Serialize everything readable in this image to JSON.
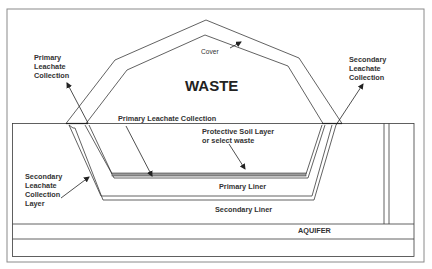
{
  "diagram": {
    "labels": {
      "waste": "WASTE",
      "cover": "Cover",
      "primary_leachate_collection_top": [
        "Primary",
        "Leachate",
        "Collection"
      ],
      "secondary_leachate_collection_top": [
        "Secondary",
        "Leachate",
        "Collection"
      ],
      "primary_leachate_collection_mid": "Primary Leachate Collection",
      "protective_soil_layer": [
        "Protective Soil Layer",
        "or select waste"
      ],
      "secondary_leachate_collection_layer": [
        "Secondary",
        "Leachate",
        "Collection",
        "Layer"
      ],
      "primary_liner": "Primary Liner",
      "secondary_liner": "Secondary Liner",
      "aquifer": "AQUIFER"
    },
    "colors": {
      "line": "#3a3a3a",
      "frame": "#8a8a8a",
      "collection_layer_fill": "#9a9a9a",
      "text": "#333333"
    }
  }
}
